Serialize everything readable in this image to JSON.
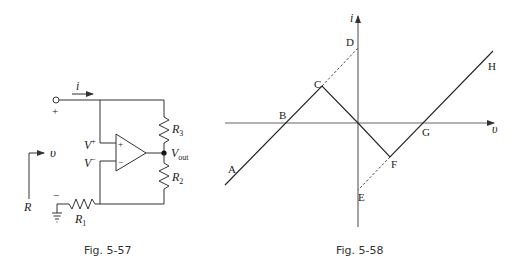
{
  "figures": [
    {
      "id": "fig-5-57",
      "caption": "Fig. 5-57",
      "type": "op-amp negative resistance circuit",
      "labels": {
        "current": "i",
        "plus_terminal": "+",
        "minus_terminal": "−",
        "v_plus": "V",
        "v_plus_sup": "+",
        "v_minus": "V",
        "v_minus_sup": "−",
        "opamp_plus": "+",
        "opamp_minus": "−",
        "r3": "R",
        "r3_sub": "3",
        "r2": "R",
        "r2_sub": "2",
        "r1": "R",
        "r1_sub": "1",
        "vout": "V",
        "vout_sub": "out",
        "v_arrow": "υ",
        "r_label": "R"
      }
    },
    {
      "id": "fig-5-58",
      "caption": "Fig. 5-58",
      "type": "piecewise-linear i-v characteristic",
      "axes": {
        "x": "υ",
        "y": "i"
      },
      "points": [
        "A",
        "B",
        "C",
        "D",
        "E",
        "F",
        "G",
        "H"
      ]
    }
  ]
}
